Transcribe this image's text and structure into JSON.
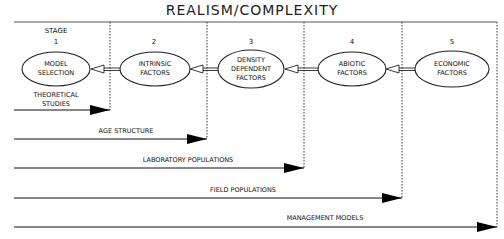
{
  "title": "REALISM/COMPLEXITY",
  "stage_label": "STAGE",
  "stages": [
    {
      "number": "1",
      "lines": [
        "MODEL",
        "SELECTION"
      ]
    },
    {
      "number": "2",
      "lines": [
        "INTRINSIC",
        "FACTORS"
      ]
    },
    {
      "number": "3",
      "lines": [
        "DENSITY",
        "DEPENDENT",
        "FACTORS"
      ]
    },
    {
      "number": "4",
      "lines": [
        "ABIOTIC",
        "FACTORS"
      ]
    },
    {
      "number": "5",
      "lines": [
        "ECONOMIC",
        "FACTORS"
      ]
    }
  ],
  "arrows": [
    {
      "lines": [
        "THEORETICAL",
        "STUDIES"
      ],
      "end_stage": 1
    },
    {
      "lines": [
        "AGE STRUCTURE"
      ],
      "end_stage": 2
    },
    {
      "lines": [
        "LABORATORY POPULATIONS"
      ],
      "end_stage": 3
    },
    {
      "lines": [
        "FIELD POPULATIONS"
      ],
      "end_stage": 4
    },
    {
      "lines": [
        "MANAGEMENT MODELS"
      ],
      "end_stage": 5
    }
  ]
}
